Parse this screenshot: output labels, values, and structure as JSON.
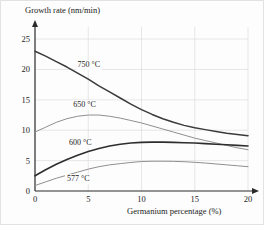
{
  "figure": {
    "background": "#fdfdfd",
    "border_color": "#e2e2e2"
  },
  "chart_data": {
    "type": "line",
    "title": "",
    "xlabel": "Germanium percentage (%)",
    "ylabel": "Growth rate (nm/min)",
    "xlim": [
      0,
      20
    ],
    "ylim": [
      0,
      26
    ],
    "xticks": [
      "0",
      "5",
      "10",
      "15",
      "20"
    ],
    "xtick_values": [
      0,
      5,
      10,
      15,
      20
    ],
    "yticks": [
      "0",
      "5",
      "10",
      "15",
      "20",
      "25"
    ],
    "ytick_values": [
      0,
      5,
      10,
      15,
      20,
      25
    ],
    "grid": true,
    "grid_color": "#dcdcdc",
    "legend": "inline-labels",
    "x": [
      0,
      1,
      2,
      3,
      4,
      5,
      6,
      7,
      8,
      9,
      10,
      11,
      12,
      13,
      14,
      15,
      16,
      17,
      18,
      19,
      20
    ],
    "series": [
      {
        "name": "750 °C",
        "label": "750 °C",
        "color": "#3a3a3a",
        "width": 1.5,
        "label_x": 4.0,
        "label_y": 20.4,
        "values": [
          23.0,
          22.2,
          21.3,
          20.4,
          19.4,
          18.4,
          17.3,
          16.3,
          15.3,
          14.3,
          13.4,
          12.6,
          11.9,
          11.3,
          10.8,
          10.4,
          10.1,
          9.8,
          9.5,
          9.3,
          9.1
        ]
      },
      {
        "name": "650 °C",
        "label": "650 °C",
        "color": "#8f8f8f",
        "width": 1.0,
        "label_x": 3.6,
        "label_y": 13.8,
        "values": [
          9.7,
          10.5,
          11.3,
          11.9,
          12.3,
          12.5,
          12.5,
          12.3,
          12.0,
          11.6,
          11.2,
          10.7,
          10.2,
          9.7,
          9.2,
          8.7,
          8.3,
          7.9,
          7.5,
          7.1,
          6.8
        ]
      },
      {
        "name": "600 °C",
        "label": "600 °C",
        "color": "#2e2e2e",
        "width": 1.6,
        "label_x": 3.2,
        "label_y": 7.5,
        "values": [
          2.5,
          3.5,
          4.4,
          5.2,
          5.9,
          6.5,
          7.0,
          7.4,
          7.7,
          7.9,
          8.0,
          8.05,
          8.05,
          8.0,
          7.95,
          7.9,
          7.8,
          7.7,
          7.6,
          7.5,
          7.4
        ]
      },
      {
        "name": "577 °C",
        "label": "577 °C",
        "color": "#8f8f8f",
        "width": 1.0,
        "label_x": 3.0,
        "label_y": 1.6,
        "values": [
          0.9,
          1.5,
          2.1,
          2.6,
          3.1,
          3.6,
          4.0,
          4.3,
          4.5,
          4.7,
          4.85,
          4.9,
          4.9,
          4.88,
          4.82,
          4.72,
          4.6,
          4.45,
          4.3,
          4.15,
          4.0
        ]
      }
    ]
  }
}
